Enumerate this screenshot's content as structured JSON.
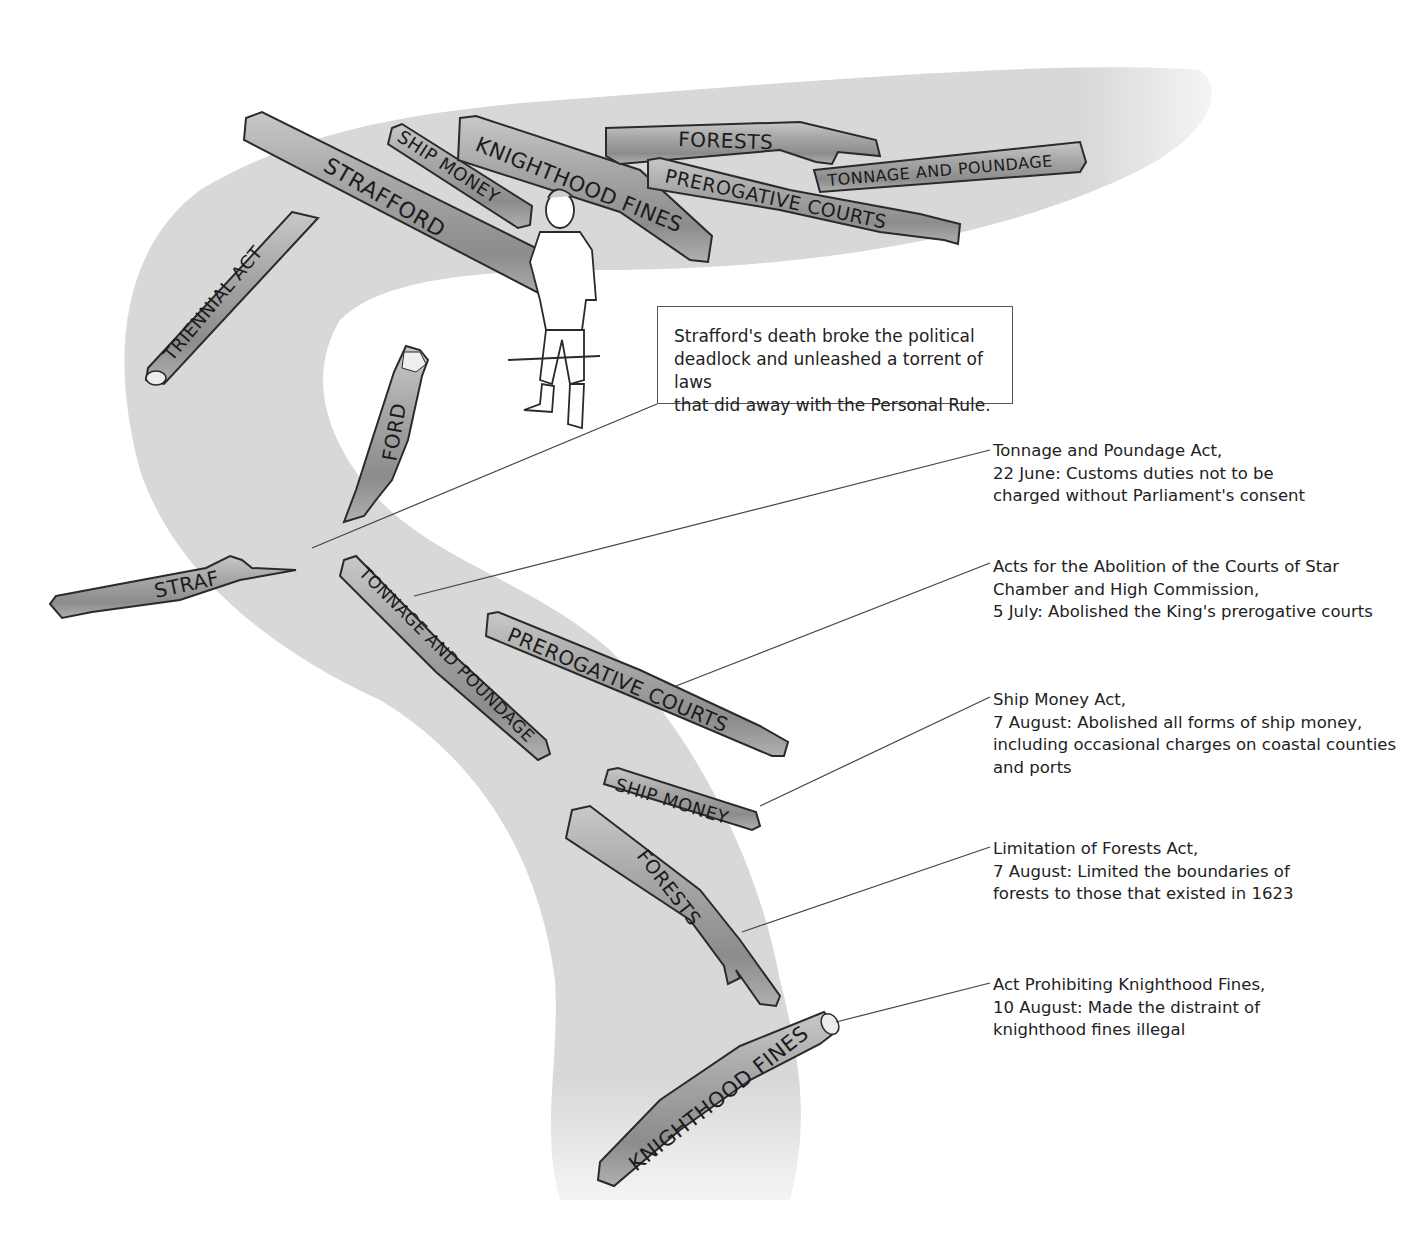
{
  "callout": {
    "lines": [
      "Strafford's death broke the political",
      "deadlock and unleashed a torrent of laws",
      "that did away with the Personal Rule."
    ]
  },
  "annotations": [
    {
      "id": "tonnage",
      "lines": [
        "Tonnage and Poundage Act,",
        "22 June: Customs duties not to be",
        "charged without Parliament's consent"
      ]
    },
    {
      "id": "prerogative",
      "lines": [
        "Acts for the Abolition of the Courts of Star",
        "Chamber and High Commission,",
        "5 July: Abolished the King's prerogative courts"
      ]
    },
    {
      "id": "ship-money",
      "lines": [
        "Ship Money Act,",
        "7 August: Abolished all forms of ship money,",
        "including occasional charges on coastal counties",
        "and ports"
      ]
    },
    {
      "id": "forests",
      "lines": [
        "Limitation of Forests Act,",
        "7 August: Limited the boundaries of",
        "forests to those that existed in 1623"
      ]
    },
    {
      "id": "knighthood",
      "lines": [
        "Act Prohibiting Knighthood Fines,",
        "10 August: Made the distraint of",
        "knighthood fines illegal"
      ]
    }
  ],
  "logs": {
    "upstream": {
      "strafford": "STRAFFORD",
      "ship_money": "SHIP MONEY",
      "knighthood_fines": "KNIGHTHOOD FINES",
      "forests": "FORESTS",
      "prerogative_courts": "PREROGATIVE COURTS",
      "tonnage_poundage": "TONNAGE AND POUNDAGE",
      "triennial_act": "TRIENNIAL ACT"
    },
    "broken": {
      "ford": "FORD",
      "straf": "STRAF"
    },
    "downstream": {
      "tonnage_poundage": "TONNAGE AND POUNDAGE",
      "prerogative_courts": "PREROGATIVE COURTS",
      "ship_money": "SHIP MONEY",
      "forests": "FORESTS",
      "knighthood_fines": "KNIGHTHOOD FINES"
    }
  },
  "colors": {
    "river": "#d9d9d9",
    "log_fill": "#9a9a9a",
    "log_highlight": "#c4c4c4",
    "log_outline": "#2a2a2a",
    "leader_line": "#444444",
    "text": "#222222"
  }
}
